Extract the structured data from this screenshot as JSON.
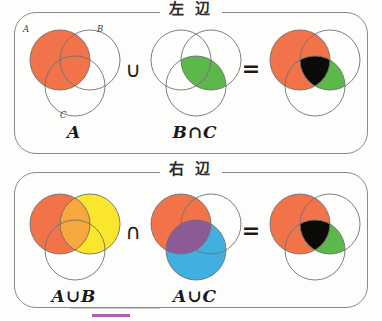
{
  "page": {
    "background": "#fdfdfc",
    "accent_rule_color": "#b55cb0"
  },
  "panels": [
    {
      "id": "left",
      "title": "左 辺",
      "title_meaning": "left side",
      "expression": "A ∪ (B∩C)",
      "cells": [
        {
          "label": "A",
          "name": "venn-a"
        },
        {
          "label": "B∩C",
          "name": "venn-b-cap-c"
        },
        {
          "label": "",
          "name": "venn-result-left"
        }
      ],
      "operator": "∪",
      "equals": "=",
      "set_tags": [
        "A",
        "B",
        "C"
      ]
    },
    {
      "id": "right",
      "title": "右 辺",
      "title_meaning": "right side",
      "expression": "(A∪B) ∩ (A∪C)",
      "cells": [
        {
          "label": "A∪B",
          "name": "venn-a-cup-b"
        },
        {
          "label": "A∪C",
          "name": "venn-a-cup-c"
        },
        {
          "label": "",
          "name": "venn-result-right"
        }
      ],
      "operator": "∩",
      "equals": "="
    }
  ],
  "colors": {
    "orange": "#F2734A",
    "green": "#5CB84B",
    "yellow": "#FAE62D",
    "orange_yellow_blend": "#F7A83C",
    "blue": "#41B0E0",
    "purple": "#8C5A96",
    "black": "#0B0B07",
    "outline": "#6f6f6f",
    "panel_border": "#8a8a8a",
    "text": "#1a1a1a"
  },
  "geometry": {
    "note": "three circles: A upper-left, B upper-right, C bottom-center",
    "radius": 30,
    "circle_a": {
      "cx": 38,
      "cy": 38
    },
    "circle_b": {
      "cx": 68,
      "cy": 38
    },
    "circle_c": {
      "cx": 53,
      "cy": 64
    }
  }
}
